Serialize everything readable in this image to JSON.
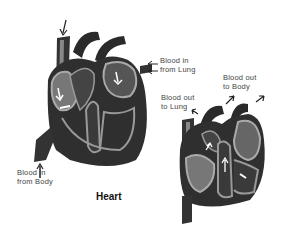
{
  "diagram": {
    "title": "Heart",
    "labels": {
      "blood_in_lung_1": "Blood in",
      "blood_in_lung_2": "from Lung",
      "blood_out_body_1": "Blood out",
      "blood_out_body_2": "to Body",
      "blood_out_lung_1": "Blood out",
      "blood_out_lung_2": "to Lung",
      "blood_in_body_1": "Blood in",
      "blood_in_body_2": "from Body"
    },
    "colors": {
      "dark": "#2a2a2a",
      "mid": "#555555",
      "light": "#9a9a9a",
      "background": "#ffffff"
    }
  }
}
